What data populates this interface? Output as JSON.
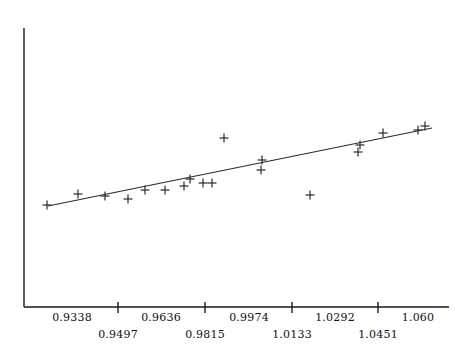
{
  "chart_data": {
    "type": "scatter",
    "title": "",
    "subtitle": "",
    "xlabel": "",
    "ylabel": "",
    "grid": false,
    "legend": null,
    "xlim": [
      0.9258,
      1.069
    ],
    "ylim": [
      0.0,
      1.0
    ],
    "x_tick_labels": [
      "0.9338",
      "0.9497",
      "0.9636",
      "0.9815",
      "0.9974",
      "1.0133",
      "1.0292",
      "1.0451",
      "1.060"
    ],
    "x_tick_values": [
      0.9338,
      0.9497,
      0.9636,
      0.9815,
      0.9974,
      1.0133,
      1.0292,
      1.0451,
      1.06
    ],
    "x_tick_rows": [
      0,
      1,
      0,
      1,
      0,
      1,
      0,
      1,
      0
    ],
    "y_tick_labels": [],
    "marker": "plus",
    "marker_color": "#2b2b2b",
    "axis_color": "#1a1a1a",
    "fit_line": {
      "label": "least-squares fit",
      "color": "#2b2b2b",
      "x_start": 0.9296,
      "x_end": 1.068,
      "y_start": 0.362,
      "y_end": 0.648
    },
    "series": [
      {
        "name": "observations",
        "points": [
          {
            "x": 0.9296,
            "y": 0.366
          },
          {
            "x": 0.9425,
            "y": 0.405
          },
          {
            "x": 0.9538,
            "y": 0.398
          },
          {
            "x": 0.9633,
            "y": 0.387
          },
          {
            "x": 0.9704,
            "y": 0.419
          },
          {
            "x": 0.9787,
            "y": 0.421
          },
          {
            "x": 0.9866,
            "y": 0.441
          },
          {
            "x": 0.997,
            "y": 0.459
          },
          {
            "x": 1.0023,
            "y": 0.445
          },
          {
            "x": 1.006,
            "y": 0.445
          },
          {
            "x": 1.011,
            "y": 0.602
          },
          {
            "x": 1.0266,
            "y": 0.52
          },
          {
            "x": 1.0262,
            "y": 0.484
          },
          {
            "x": 1.0464,
            "y": 0.394
          },
          {
            "x": 1.067,
            "y": 0.566
          },
          {
            "x": 1.0662,
            "y": 0.541
          },
          {
            "x": 1.0748,
            "y": 0.609
          },
          {
            "x": 1.0865,
            "y": 0.617
          },
          {
            "x": 1.089,
            "y": 0.631
          }
        ]
      }
    ]
  },
  "geometry": {
    "axis": {
      "x0": 24,
      "y0": 28,
      "y1": 307,
      "x1": 449
    },
    "plot": {
      "left": 24,
      "top": 28,
      "right": 449,
      "bottom": 307
    },
    "tick_px": [
      118,
      205,
      292,
      378
    ],
    "tick_label_px": [
      72,
      118,
      161,
      205,
      249,
      292,
      335,
      378,
      418
    ],
    "marker_size": 9,
    "point_px": [
      [
        47,
        205
      ],
      [
        78,
        194
      ],
      [
        105,
        196
      ],
      [
        128,
        199
      ],
      [
        145,
        190
      ],
      [
        165,
        190
      ],
      [
        184,
        186
      ],
      [
        190,
        179
      ],
      [
        203,
        183
      ],
      [
        212,
        183
      ],
      [
        224,
        138
      ],
      [
        262,
        160
      ],
      [
        261,
        170
      ],
      [
        310,
        195
      ],
      [
        360,
        145
      ],
      [
        358,
        152
      ],
      [
        383,
        133
      ],
      [
        418,
        130
      ],
      [
        425,
        126
      ]
    ],
    "line_px": {
      "x1": 48,
      "y1": 206,
      "x2": 432,
      "y2": 128
    }
  }
}
